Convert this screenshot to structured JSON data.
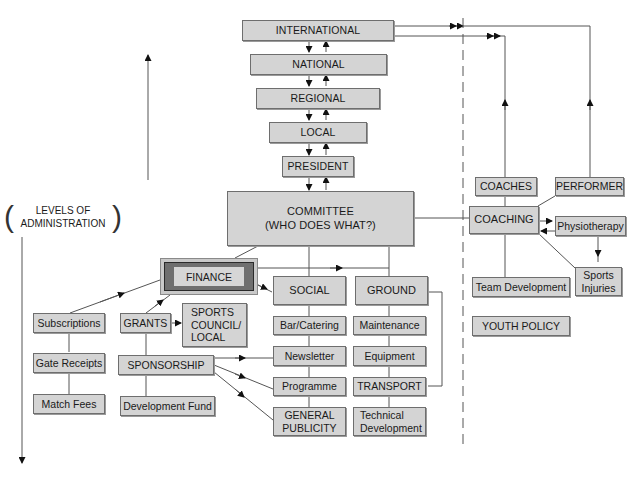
{
  "levels": {
    "international": "INTERNATIONAL",
    "national": "NATIONAL",
    "regional": "REGIONAL",
    "local": "LOCAL",
    "president": "PRESIDENT"
  },
  "committee": {
    "line1": "COMMITTEE",
    "line2": "(WHO DOES WHAT?)"
  },
  "axis_label": {
    "line1": "LEVELS OF",
    "line2": "ADMINISTRATION"
  },
  "finance": {
    "label": "FINANCE",
    "income": [
      "Subscriptions",
      "Gate Receipts",
      "Match Fees"
    ],
    "grants": "GRANTS",
    "sports_council": "SPORTS\nCOUNCIL/\nLOCAL",
    "sponsorship": "SPONSORSHIP",
    "development_fund": "Development Fund"
  },
  "social": {
    "label": "SOCIAL",
    "items": [
      "Bar/Catering",
      "Newsletter",
      "Programme",
      "GENERAL\nPUBLICITY"
    ]
  },
  "ground": {
    "label": "GROUND",
    "items": [
      "Maintenance",
      "Equipment",
      "TRANSPORT",
      "Technical\nDevelopment"
    ]
  },
  "coaching_side": {
    "coaches": "COACHES",
    "performer": "PERFORMER",
    "coaching": "COACHING",
    "physiotherapy": "Physiotherapy",
    "sports_injuries": "Sports\nInjuries",
    "team_development": "Team Development",
    "youth_policy": "YOUTH POLICY"
  },
  "colors": {
    "box_fill": "#d4d4d4",
    "box_border": "#6e6e6e",
    "finance_frame": "#6f6f6f",
    "line": "#555555",
    "background": "#ffffff"
  }
}
